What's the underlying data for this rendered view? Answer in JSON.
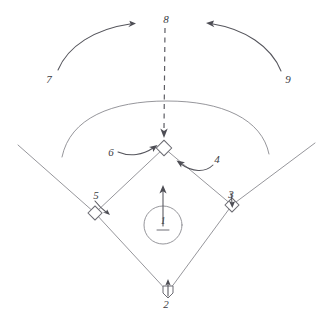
{
  "diagram": {
    "background_color": "#ffffff",
    "line_color": "#6f6f76",
    "label_color": "#3b3b42",
    "style": "hand-drawn pencil sketch"
  },
  "positions": [
    {
      "number": "1",
      "name": "pitcher",
      "label_x": 163,
      "label_y": 222
    },
    {
      "number": "2",
      "name": "catcher",
      "label_x": 166,
      "label_y": 305
    },
    {
      "number": "3",
      "name": "first-base",
      "label_x": 231,
      "label_y": 195
    },
    {
      "number": "4",
      "name": "second-base",
      "label_x": 217,
      "label_y": 160
    },
    {
      "number": "5",
      "name": "third-base",
      "label_x": 96,
      "label_y": 196
    },
    {
      "number": "6",
      "name": "shortstop",
      "label_x": 111,
      "label_y": 153
    },
    {
      "number": "7",
      "name": "left-field",
      "label_x": 49,
      "label_y": 80
    },
    {
      "number": "8",
      "name": "center-field",
      "label_x": 166,
      "label_y": 20
    },
    {
      "number": "9",
      "name": "right-field",
      "label_x": 288,
      "label_y": 80
    }
  ],
  "bases": [
    {
      "name": "home-plate",
      "x": 168,
      "y": 292
    },
    {
      "name": "first-base",
      "x": 232,
      "y": 205
    },
    {
      "name": "second-base",
      "x": 164,
      "y": 148
    },
    {
      "name": "third-base",
      "x": 95,
      "y": 213
    }
  ],
  "mound": {
    "name": "pitchers-mound",
    "x": 163,
    "y": 225,
    "radius": 19
  }
}
